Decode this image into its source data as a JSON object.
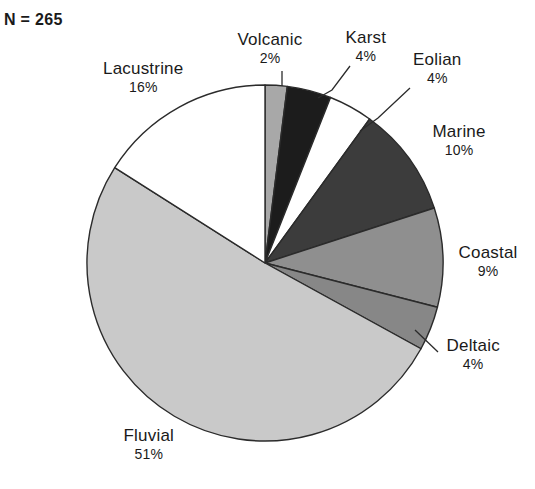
{
  "figure": {
    "cut_off_title": "Depositional environment",
    "sample_size_label": "N = 265"
  },
  "chart_data": {
    "type": "pie",
    "title": "",
    "subtitle": "N = 265",
    "total_n": 265,
    "units": "percent",
    "legend": "none",
    "labels_position": "outside-with-leader-lines",
    "start_angle_deg": 0,
    "direction": "clockwise",
    "categories": [
      "Volcanic",
      "Karst",
      "Eolian",
      "Marine",
      "Coastal",
      "Deltaic",
      "Fluvial",
      "Lacustrine"
    ],
    "values": [
      2,
      4,
      4,
      10,
      9,
      4,
      51,
      16
    ],
    "slices": [
      {
        "label": "Volcanic",
        "value": 2,
        "pct_text": "2%",
        "color": "#a8a8a8",
        "start_deg": 0.0,
        "end_deg": 7.2,
        "label_x": 270,
        "label_y": 30,
        "leader": [
          [
            282,
            71
          ],
          [
            282,
            86
          ]
        ]
      },
      {
        "label": "Karst",
        "value": 4,
        "pct_text": "4%",
        "color": "#1c1c1c",
        "start_deg": 7.2,
        "end_deg": 21.6,
        "label_x": 366,
        "label_y": 28,
        "leader": [
          [
            350,
            66
          ],
          [
            332,
            90
          ],
          [
            318,
            98
          ]
        ]
      },
      {
        "label": "Eolian",
        "value": 4,
        "pct_text": "4%",
        "color": "#ffffff",
        "start_deg": 21.6,
        "end_deg": 36.0,
        "label_x": 437,
        "label_y": 50,
        "leader": [
          [
            410,
            88
          ],
          [
            378,
            118
          ],
          [
            360,
            131
          ]
        ]
      },
      {
        "label": "Marine",
        "value": 10,
        "pct_text": "10%",
        "color": "#3c3c3c",
        "start_deg": 36.0,
        "end_deg": 72.0,
        "label_x": 459,
        "label_y": 122,
        "leader": []
      },
      {
        "label": "Coastal",
        "value": 9,
        "pct_text": "9%",
        "color": "#8f8f8f",
        "start_deg": 72.0,
        "end_deg": 104.4,
        "label_x": 488,
        "label_y": 243,
        "leader": []
      },
      {
        "label": "Deltaic",
        "value": 4,
        "pct_text": "4%",
        "color": "#878787",
        "start_deg": 104.4,
        "end_deg": 118.8,
        "label_x": 473,
        "label_y": 336,
        "leader": [
          [
            438,
            352
          ],
          [
            415,
            330
          ]
        ]
      },
      {
        "label": "Fluvial",
        "value": 51,
        "pct_text": "51%",
        "color": "#c9c9c9",
        "start_deg": 118.8,
        "end_deg": 302.4,
        "label_x": 149,
        "label_y": 426,
        "leader": []
      },
      {
        "label": "Lacustrine",
        "value": 16,
        "pct_text": "16%",
        "color": "#ffffff",
        "start_deg": 302.4,
        "end_deg": 360.0,
        "label_x": 143,
        "label_y": 59,
        "leader": []
      }
    ],
    "geometry": {
      "center_x": 265,
      "center_y": 263,
      "radius": 178
    },
    "style": {
      "stroke": "#2b2b2b",
      "stroke_width": 1.4,
      "background": "#ffffff"
    }
  }
}
